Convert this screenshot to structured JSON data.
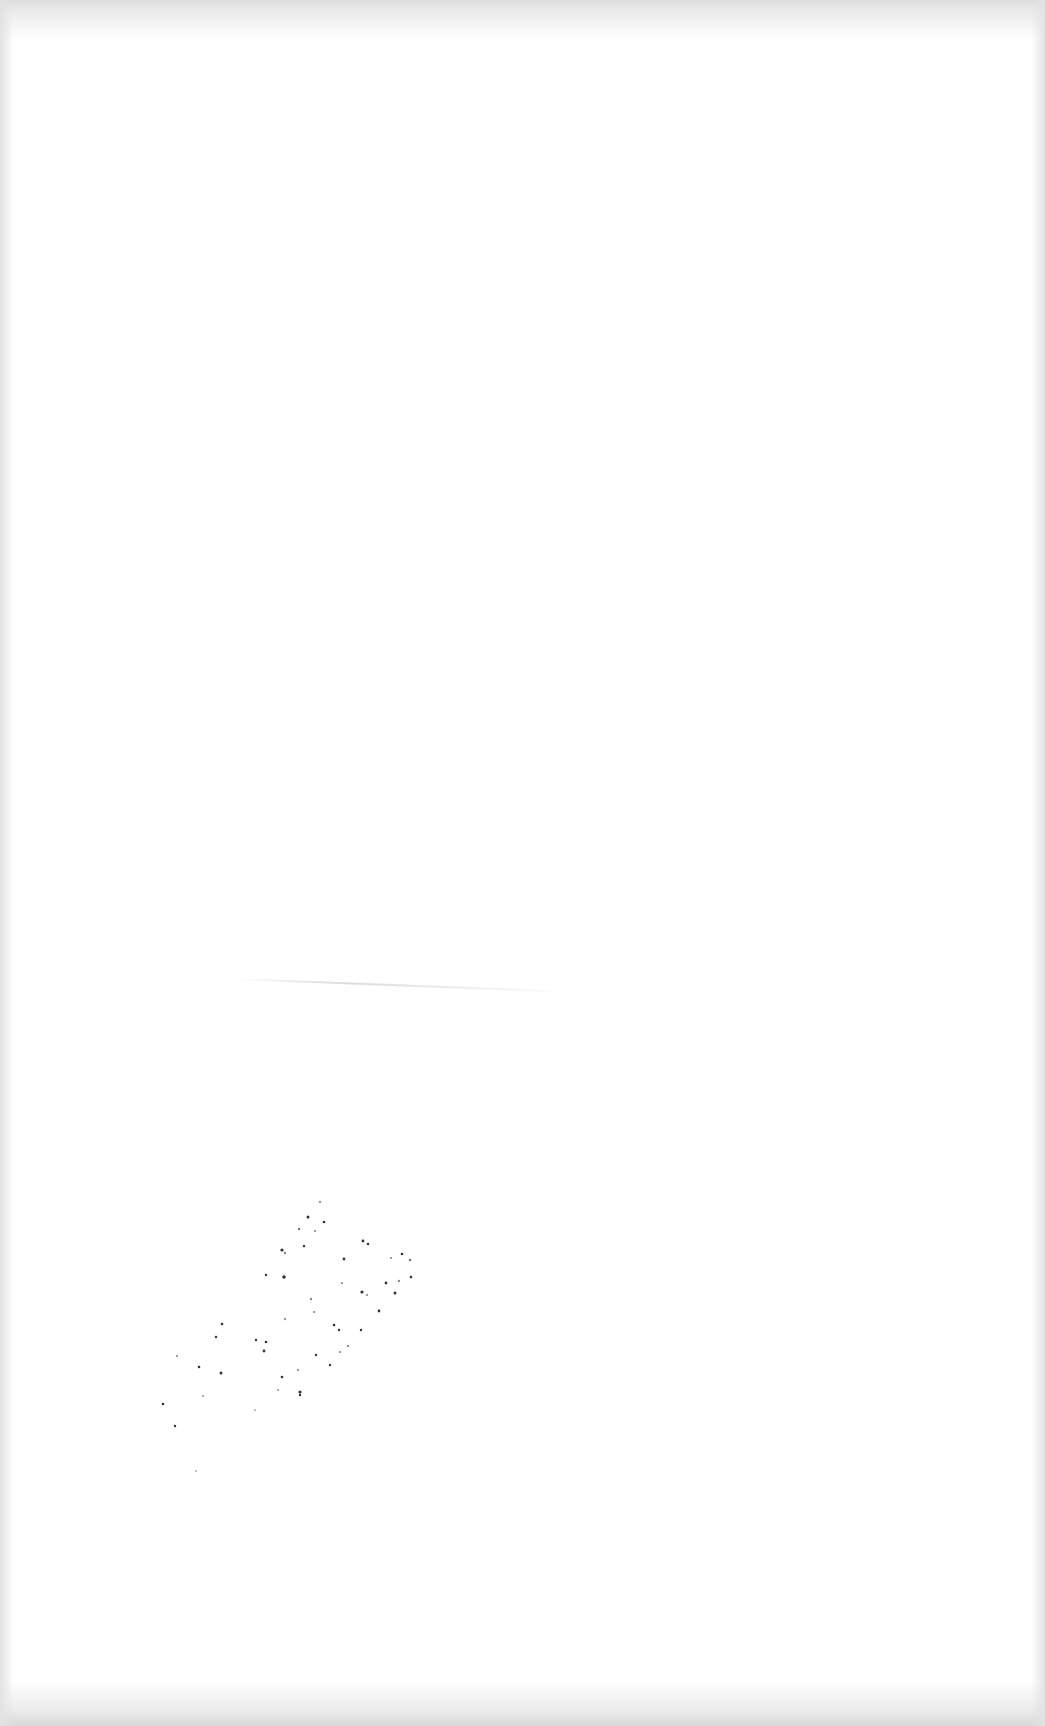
{
  "document": {
    "type": "blank scanned page",
    "text_content": "",
    "background_color": "#ffffff",
    "edge_shadow_color": "#dcdcdc",
    "speckle_color": "#333333"
  }
}
